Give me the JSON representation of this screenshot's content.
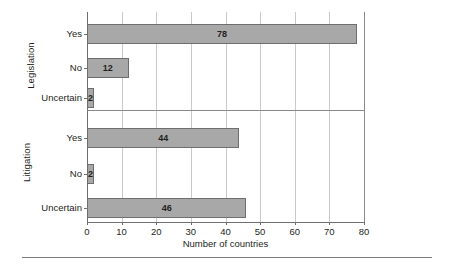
{
  "chart_data": {
    "type": "bar",
    "orientation": "horizontal",
    "title": "",
    "xlabel": "Number of countries",
    "ylabel": "",
    "xlim": [
      0,
      80
    ],
    "xticks": [
      0,
      10,
      20,
      30,
      40,
      50,
      60,
      70,
      80
    ],
    "grid": true,
    "legend": false,
    "panels": [
      {
        "name": "Legislation",
        "categories": [
          "Yes",
          "No",
          "Uncertain"
        ],
        "values": [
          78,
          12,
          2
        ]
      },
      {
        "name": "Litigation",
        "categories": [
          "Yes",
          "No",
          "Uncertain"
        ],
        "values": [
          44,
          2,
          46
        ]
      }
    ],
    "colors": {
      "bar_fill": "#a8a8a8",
      "bar_border": "#6e6e6e",
      "gridline": "#c9c9c9",
      "axis": "#6f6f6f",
      "text": "#231f20"
    }
  },
  "axis": {
    "x_title": "Number of countries",
    "tick_labels": [
      "0",
      "10",
      "20",
      "30",
      "40",
      "50",
      "60",
      "70",
      "80"
    ]
  },
  "groups": {
    "legislation": {
      "label": "Legislation",
      "rows": [
        {
          "label": "Yes",
          "value": 78,
          "value_text": "78"
        },
        {
          "label": "No",
          "value": 12,
          "value_text": "12"
        },
        {
          "label": "Uncertain",
          "value": 2,
          "value_text": "2"
        }
      ]
    },
    "litigation": {
      "label": "Litigation",
      "rows": [
        {
          "label": "Yes",
          "value": 44,
          "value_text": "44"
        },
        {
          "label": "No",
          "value": 2,
          "value_text": "2"
        },
        {
          "label": "Uncertain",
          "value": 46,
          "value_text": "46"
        }
      ]
    }
  }
}
